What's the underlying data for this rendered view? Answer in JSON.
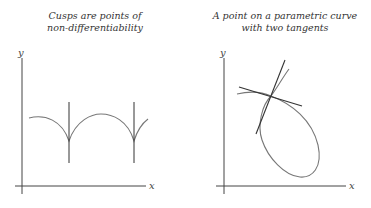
{
  "panels": [
    {
      "title_line1": "Cusps are points of",
      "title_line2": "non-differentiability",
      "x_label": "x",
      "y_label": "y"
    },
    {
      "title_line1": "A point on a parametric curve",
      "title_line2": "with two tangents",
      "x_label": "x",
      "y_label": "y"
    }
  ],
  "colors": {
    "curve": "#777777",
    "axis": "#444444",
    "tangent": "#333333"
  }
}
